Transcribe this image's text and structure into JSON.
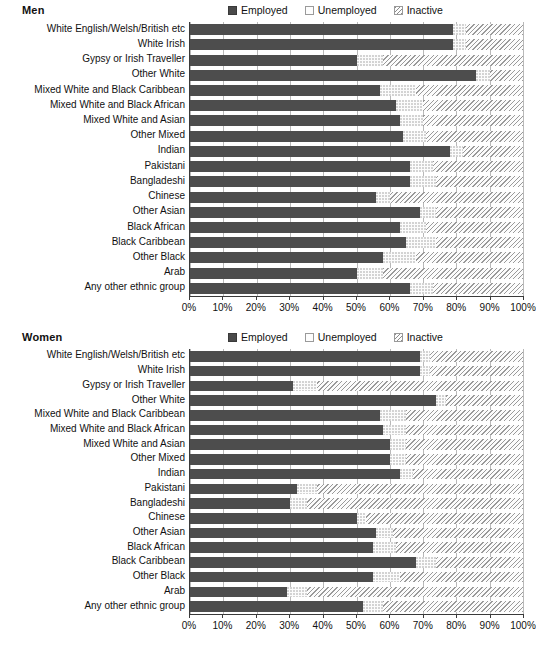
{
  "legend": {
    "items": [
      {
        "label": "Employed",
        "icon": "employed-swatch-icon",
        "color": "#4d4d4d"
      },
      {
        "label": "Unemployed",
        "icon": "unemployed-swatch-icon",
        "color": "#fcfcfc"
      },
      {
        "label": "Inactive",
        "icon": "inactive-swatch-icon",
        "color": "#fcfcfc"
      }
    ]
  },
  "axis": {
    "ticks": [
      "0%",
      "10%",
      "20%",
      "30%",
      "40%",
      "50%",
      "60%",
      "70%",
      "80%",
      "90%",
      "100%"
    ],
    "min": 0,
    "max": 100
  },
  "panels": [
    {
      "title": "Men"
    },
    {
      "title": "Women"
    }
  ],
  "chart_data": [
    {
      "type": "bar",
      "orientation": "horizontal",
      "stacked": true,
      "title": "Men",
      "xlabel": "",
      "ylabel": "",
      "xlim": [
        0,
        100
      ],
      "grid": true,
      "legend_position": "top-right",
      "categories": [
        "White English/Welsh/British etc",
        "White Irish",
        "Gypsy or Irish Traveller",
        "Other White",
        "Mixed White and Black Caribbean",
        "Mixed White and Black African",
        "Mixed White and Asian",
        "Other Mixed",
        "Indian",
        "Pakistani",
        "Bangladeshi",
        "Chinese",
        "Other Asian",
        "Black African",
        "Black Caribbean",
        "Other Black",
        "Arab",
        "Any other ethnic group"
      ],
      "series": [
        {
          "name": "Employed",
          "values": [
            79,
            79,
            50,
            86,
            57,
            62,
            63,
            64,
            78,
            66,
            66,
            56,
            69,
            63,
            65,
            58,
            50,
            66
          ]
        },
        {
          "name": "Unemployed",
          "values": [
            4,
            4,
            8,
            4,
            11,
            8,
            7,
            7,
            4,
            7,
            8,
            4,
            5,
            8,
            9,
            10,
            8,
            7
          ]
        },
        {
          "name": "Inactive",
          "values": [
            17,
            17,
            42,
            10,
            32,
            30,
            30,
            29,
            18,
            27,
            26,
            40,
            26,
            29,
            26,
            32,
            42,
            27
          ]
        }
      ]
    },
    {
      "type": "bar",
      "orientation": "horizontal",
      "stacked": true,
      "title": "Women",
      "xlabel": "",
      "ylabel": "",
      "xlim": [
        0,
        100
      ],
      "grid": true,
      "legend_position": "top-right",
      "categories": [
        "White English/Welsh/British etc",
        "White Irish",
        "Gypsy or Irish Traveller",
        "Other White",
        "Mixed White and Black Caribbean",
        "Mixed White and Black African",
        "Mixed White and Asian",
        "Other Mixed",
        "Indian",
        "Pakistani",
        "Bangladeshi",
        "Chinese",
        "Other Asian",
        "Black African",
        "Black Caribbean",
        "Other Black",
        "Arab",
        "Any other ethnic group"
      ],
      "series": [
        {
          "name": "Employed",
          "values": [
            69,
            69,
            31,
            74,
            57,
            58,
            60,
            60,
            63,
            32,
            30,
            50,
            56,
            55,
            68,
            55,
            29,
            52
          ]
        },
        {
          "name": "Unemployed",
          "values": [
            3,
            3,
            7,
            3,
            8,
            7,
            5,
            5,
            4,
            6,
            5,
            3,
            5,
            7,
            6,
            8,
            6,
            6
          ]
        },
        {
          "name": "Inactive",
          "values": [
            28,
            28,
            62,
            23,
            35,
            35,
            35,
            35,
            33,
            62,
            65,
            47,
            39,
            38,
            26,
            37,
            65,
            42
          ]
        }
      ]
    }
  ]
}
